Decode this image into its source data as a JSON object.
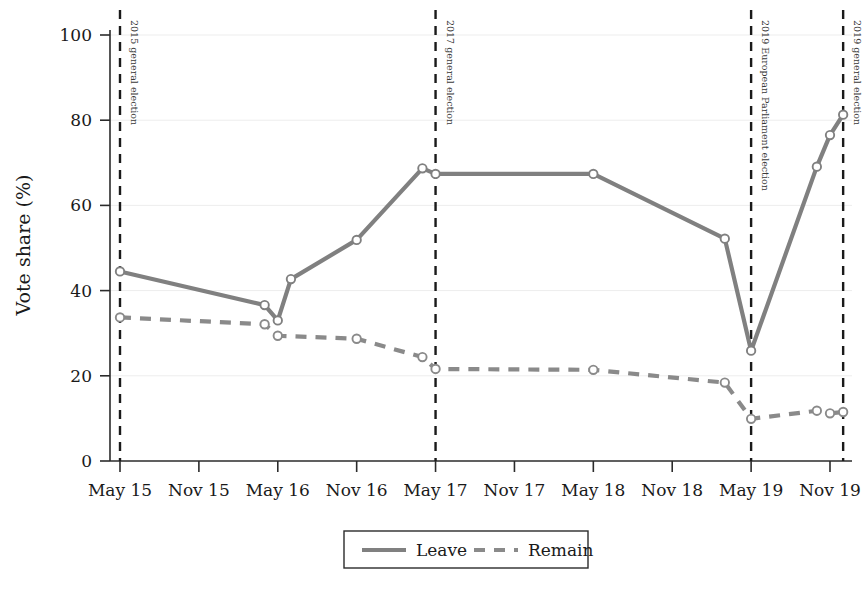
{
  "chart_data": {
    "type": "line",
    "title": "",
    "xlabel": "",
    "ylabel": "Vote share (%)",
    "ylim": [
      0,
      100
    ],
    "yticks": [
      0,
      20,
      40,
      60,
      80,
      100
    ],
    "grid": true,
    "legend_position": "bottom",
    "x_tick_labels": [
      "May 15",
      "Nov 15",
      "May 16",
      "Nov 16",
      "May 17",
      "Nov 17",
      "May 18",
      "Nov 18",
      "May 19",
      "Nov 19"
    ],
    "x_tick_dates": [
      "2015-05",
      "2015-11",
      "2016-05",
      "2016-11",
      "2017-05",
      "2017-11",
      "2018-05",
      "2018-11",
      "2019-05",
      "2019-11"
    ],
    "series": [
      {
        "name": "Leave",
        "style": "solid",
        "color": "#808080",
        "marker": "open-circle",
        "points": [
          {
            "x": "2015-05",
            "y": 44.5
          },
          {
            "x": "2016-04",
            "y": 36.6
          },
          {
            "x": "2016-05",
            "y": 33.0
          },
          {
            "x": "2016-06",
            "y": 42.7
          },
          {
            "x": "2016-11",
            "y": 51.9
          },
          {
            "x": "2017-04",
            "y": 68.7
          },
          {
            "x": "2017-05",
            "y": 67.4
          },
          {
            "x": "2018-05",
            "y": 67.4
          },
          {
            "x": "2019-03",
            "y": 52.2
          },
          {
            "x": "2019-05",
            "y": 25.9
          },
          {
            "x": "2019-10",
            "y": 69.1
          },
          {
            "x": "2019-11",
            "y": 76.5
          },
          {
            "x": "2019-12",
            "y": 81.3
          }
        ]
      },
      {
        "name": "Remain",
        "style": "dashed",
        "color": "#8a8a8a",
        "marker": "open-circle",
        "points": [
          {
            "x": "2015-05",
            "y": 33.7
          },
          {
            "x": "2016-04",
            "y": 32.1
          },
          {
            "x": "2016-05",
            "y": 29.4
          },
          {
            "x": "2016-11",
            "y": 28.7
          },
          {
            "x": "2017-04",
            "y": 24.4
          },
          {
            "x": "2017-05",
            "y": 21.6
          },
          {
            "x": "2018-05",
            "y": 21.4
          },
          {
            "x": "2019-03",
            "y": 18.4
          },
          {
            "x": "2019-05",
            "y": 9.9
          },
          {
            "x": "2019-10",
            "y": 11.8
          },
          {
            "x": "2019-11",
            "y": 11.2
          },
          {
            "x": "2019-12",
            "y": 11.5
          }
        ]
      }
    ],
    "event_lines": [
      {
        "x": "2015-05",
        "label": "2015 general election"
      },
      {
        "x": "2017-05",
        "label": "2017 general election"
      },
      {
        "x": "2019-05",
        "label": "2019 European Parliament election"
      },
      {
        "x": "2019-12",
        "label": "2019 general election"
      }
    ],
    "legend": [
      {
        "label": "Leave",
        "style": "solid"
      },
      {
        "label": "Remain",
        "style": "dashed"
      }
    ]
  }
}
